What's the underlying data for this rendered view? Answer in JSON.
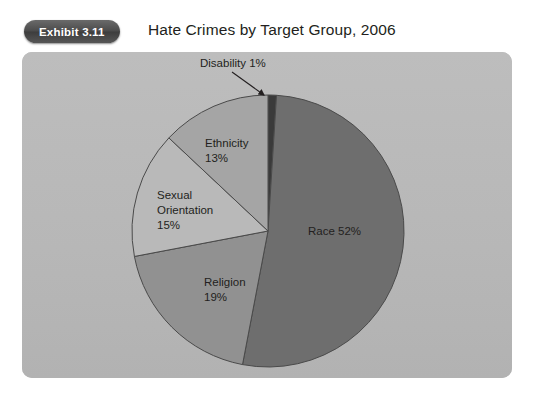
{
  "exhibit": {
    "badge_label": "Exhibit 3.11",
    "title": "Hate Crimes by Target Group, 2006"
  },
  "colors": {
    "page_background": "#ffffff",
    "panel_background": "#b9b9b9",
    "badge_background": "#4b4b4b",
    "badge_text": "#ffffff",
    "title_text": "#231f20",
    "label_text": "#231f20",
    "slice_outline": "#4a4a4a",
    "race": "#6e6e6e",
    "religion": "#919191",
    "sexual_orientation": "#b9b9b9",
    "ethnicity": "#a5a5a5",
    "disability": "#3a3a3a"
  },
  "chart_data": {
    "type": "pie",
    "title": "Hate Crimes by Target Group, 2006",
    "xlabel": "",
    "ylabel": "",
    "legend": "none",
    "grid": false,
    "units": "percent",
    "categories": [
      "Disability",
      "Race",
      "Religion",
      "Sexual Orientation",
      "Ethnicity"
    ],
    "values": [
      1,
      52,
      19,
      15,
      13
    ],
    "start_angle_deg": 0,
    "direction": "clockwise",
    "slices": [
      {
        "name": "Disability",
        "label": "Disability 1%",
        "label_name": "Disability",
        "label_value": "1%",
        "value": 1,
        "color": "#3a3a3a",
        "label_position": "outside",
        "leader_line": true
      },
      {
        "name": "Race",
        "label": "Race  52%",
        "label_name": "Race",
        "label_value": "52%",
        "value": 52,
        "color": "#6e6e6e",
        "label_position": "inside",
        "leader_line": false
      },
      {
        "name": "Religion",
        "label": "Religion 19%",
        "label_name": "Religion",
        "label_value": "19%",
        "value": 19,
        "color": "#919191",
        "label_position": "inside",
        "leader_line": false
      },
      {
        "name": "Sexual Orientation",
        "label": "Sexual Orientation 15%",
        "label_line1": "Sexual",
        "label_line2": "Orientation",
        "label_value": "15%",
        "value": 15,
        "color": "#b9b9b9",
        "label_position": "inside",
        "leader_line": false
      },
      {
        "name": "Ethnicity",
        "label": "Ethnicity 13%",
        "label_name": "Ethnicity",
        "label_value": "13%",
        "value": 13,
        "color": "#a5a5a5",
        "label_position": "inside",
        "leader_line": false
      }
    ]
  }
}
